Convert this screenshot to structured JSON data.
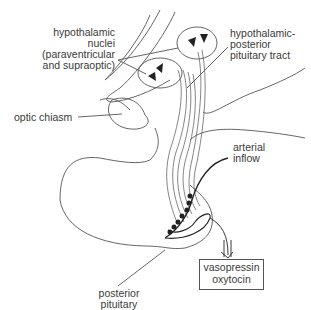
{
  "diagram": {
    "type": "anatomical illustration",
    "labels": {
      "hypothalamic_nuclei": [
        "hypothalamic",
        "nuclei",
        "(paraventricular",
        "and supraoptic)"
      ],
      "tract": [
        "hypothalamic-",
        "posterior",
        "pituitary tract"
      ],
      "optic_chiasm": "optic chiasm",
      "arterial_inflow": [
        "arterial",
        "inflow"
      ],
      "posterior_pituitary": [
        "posterior",
        "pituitary"
      ],
      "hormones_box": [
        "vasopressin",
        "oxytocin"
      ]
    },
    "colors": {
      "line": "#555555",
      "neuron": "#222222",
      "background": "#ffffff"
    }
  }
}
